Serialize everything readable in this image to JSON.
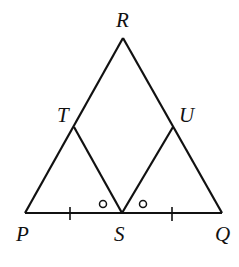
{
  "diagram": {
    "type": "geometry",
    "labels": {
      "R": "R",
      "T": "T",
      "U": "U",
      "P": "P",
      "S": "S",
      "Q": "Q"
    },
    "points": {
      "R": [
        123,
        38
      ],
      "P": [
        25,
        213
      ],
      "Q": [
        222,
        213
      ],
      "S": [
        122,
        213
      ],
      "T": [
        74,
        127
      ],
      "U": [
        173,
        127
      ]
    },
    "markings": {
      "tick_marks": "PS and SQ marked with single ticks (equal segments)",
      "angle_marks": "angles TSP and USQ marked with small circles (equal angles)"
    },
    "colors": {
      "stroke": "#111111",
      "background": "#ffffff"
    }
  }
}
